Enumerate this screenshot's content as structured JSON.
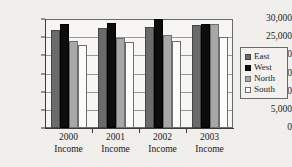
{
  "chart_data": {
    "type": "bar",
    "title": "",
    "subtitle": "",
    "xlabel": "",
    "ylabel": "",
    "categories": [
      "2000 Income",
      "2001 Income",
      "2002 Income",
      "2003 Income"
    ],
    "category_lines": [
      [
        "2000",
        "Income"
      ],
      [
        "2001",
        "Income"
      ],
      [
        "2002",
        "Income"
      ],
      [
        "2003",
        "Income"
      ]
    ],
    "series": [
      {
        "name": "East",
        "color": "#6b6b6b",
        "values": [
          27100,
          27500,
          27900,
          28300
        ]
      },
      {
        "name": "West",
        "color": "#0d0d0d",
        "values": [
          28500,
          28900,
          29900,
          28500
        ]
      },
      {
        "name": "North",
        "color": "#a8a8a8",
        "values": [
          23900,
          24900,
          25700,
          28700
        ]
      },
      {
        "name": "South",
        "color": "#fbfbf9",
        "values": [
          22800,
          23700,
          24000,
          25000
        ]
      }
    ],
    "ylim": [
      0,
      30000
    ],
    "ytick_values": [
      0,
      5000,
      10000,
      15000,
      20000,
      25000,
      30000
    ],
    "ytick_labels": [
      "0",
      "5,000",
      "10,000",
      "15,000",
      "20,000",
      "25,000",
      "30,000"
    ],
    "grid": true,
    "grid_axis": "y",
    "legend": {
      "position": "right",
      "entries": [
        "East",
        "West",
        "North",
        "South"
      ]
    }
  }
}
